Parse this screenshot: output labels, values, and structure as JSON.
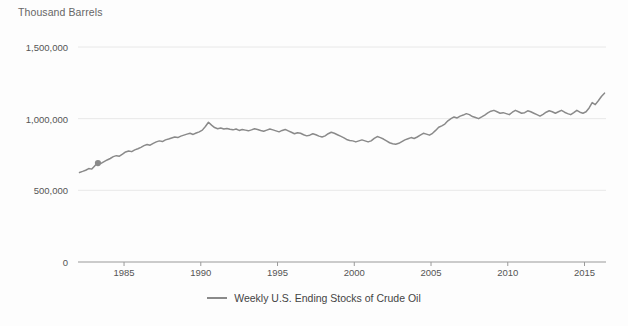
{
  "chart_data": {
    "type": "line",
    "title": "",
    "ylabel": "Thousand Barrels",
    "xlabel": "",
    "ylim": [
      0,
      1500000
    ],
    "xlim": [
      1982,
      2016.4
    ],
    "grid": true,
    "legend_position": "bottom",
    "yticks": [
      0,
      500000,
      1000000,
      1500000
    ],
    "ytick_labels": [
      "0",
      "500,000",
      "1,000,000",
      "1,500,000"
    ],
    "xticks": [
      1985,
      1990,
      1995,
      2000,
      2005,
      2010,
      2015
    ],
    "xtick_labels": [
      "1985",
      "1990",
      "1995",
      "2000",
      "2005",
      "2010",
      "2015"
    ],
    "line_color": "#8a8a8a",
    "grid_color": "#e8e8e8",
    "axis_color": "#9a9a9a",
    "background_color": "#fdfdfd",
    "series": [
      {
        "name": "Weekly U.S. Ending Stocks of Crude Oil",
        "color": "#8a8a8a",
        "marker": "dot-1983",
        "x": [
          1982.1,
          1982.3,
          1982.5,
          1982.7,
          1982.9,
          1983.1,
          1983.3,
          1983.5,
          1983.7,
          1983.9,
          1984.1,
          1984.3,
          1984.5,
          1984.7,
          1984.9,
          1985.1,
          1985.3,
          1985.5,
          1985.7,
          1985.9,
          1986.1,
          1986.3,
          1986.5,
          1986.7,
          1986.9,
          1987.1,
          1987.3,
          1987.5,
          1987.7,
          1987.9,
          1988.1,
          1988.3,
          1988.5,
          1988.7,
          1988.9,
          1989.1,
          1989.3,
          1989.5,
          1989.7,
          1989.9,
          1990.1,
          1990.3,
          1990.5,
          1990.7,
          1990.9,
          1991.1,
          1991.3,
          1991.5,
          1991.7,
          1991.9,
          1992.1,
          1992.3,
          1992.5,
          1992.7,
          1992.9,
          1993.1,
          1993.3,
          1993.5,
          1993.7,
          1993.9,
          1994.1,
          1994.3,
          1994.5,
          1994.7,
          1994.9,
          1995.1,
          1995.3,
          1995.5,
          1995.7,
          1995.9,
          1996.1,
          1996.3,
          1996.5,
          1996.7,
          1996.9,
          1997.1,
          1997.3,
          1997.5,
          1997.7,
          1997.9,
          1998.1,
          1998.3,
          1998.5,
          1998.7,
          1998.9,
          1999.1,
          1999.3,
          1999.5,
          1999.7,
          1999.9,
          2000.1,
          2000.3,
          2000.5,
          2000.7,
          2000.9,
          2001.1,
          2001.3,
          2001.5,
          2001.7,
          2001.9,
          2002.1,
          2002.3,
          2002.5,
          2002.7,
          2002.9,
          2003.1,
          2003.3,
          2003.5,
          2003.7,
          2003.9,
          2004.1,
          2004.3,
          2004.5,
          2004.7,
          2004.9,
          2005.1,
          2005.3,
          2005.5,
          2005.7,
          2005.9,
          2006.1,
          2006.3,
          2006.5,
          2006.7,
          2006.9,
          2007.1,
          2007.3,
          2007.5,
          2007.7,
          2007.9,
          2008.1,
          2008.3,
          2008.5,
          2008.7,
          2008.9,
          2009.1,
          2009.3,
          2009.5,
          2009.7,
          2009.9,
          2010.1,
          2010.3,
          2010.5,
          2010.7,
          2010.9,
          2011.1,
          2011.3,
          2011.5,
          2011.7,
          2011.9,
          2012.1,
          2012.3,
          2012.5,
          2012.7,
          2012.9,
          2013.1,
          2013.3,
          2013.5,
          2013.7,
          2013.9,
          2014.1,
          2014.3,
          2014.5,
          2014.7,
          2014.9,
          2015.1,
          2015.3,
          2015.5,
          2015.7,
          2015.9,
          2016.1,
          2016.3
        ],
        "y": [
          625000,
          632000,
          640000,
          652000,
          648000,
          672000,
          690000,
          688000,
          700000,
          712000,
          722000,
          735000,
          742000,
          738000,
          752000,
          768000,
          775000,
          770000,
          782000,
          790000,
          800000,
          812000,
          820000,
          815000,
          828000,
          838000,
          845000,
          840000,
          852000,
          858000,
          865000,
          872000,
          868000,
          878000,
          885000,
          892000,
          898000,
          890000,
          900000,
          908000,
          920000,
          945000,
          975000,
          955000,
          938000,
          930000,
          935000,
          928000,
          932000,
          926000,
          922000,
          928000,
          918000,
          925000,
          920000,
          915000,
          922000,
          930000,
          925000,
          918000,
          912000,
          920000,
          928000,
          922000,
          915000,
          908000,
          918000,
          925000,
          915000,
          905000,
          895000,
          902000,
          898000,
          888000,
          880000,
          885000,
          895000,
          888000,
          878000,
          872000,
          880000,
          895000,
          905000,
          898000,
          888000,
          878000,
          868000,
          855000,
          848000,
          845000,
          838000,
          845000,
          852000,
          845000,
          838000,
          845000,
          862000,
          875000,
          868000,
          858000,
          845000,
          832000,
          825000,
          822000,
          828000,
          840000,
          852000,
          860000,
          868000,
          862000,
          872000,
          885000,
          898000,
          892000,
          885000,
          898000,
          918000,
          940000,
          950000,
          962000,
          985000,
          1000000,
          1012000,
          1005000,
          1018000,
          1025000,
          1035000,
          1028000,
          1015000,
          1008000,
          1000000,
          1012000,
          1025000,
          1040000,
          1052000,
          1058000,
          1048000,
          1038000,
          1042000,
          1035000,
          1028000,
          1045000,
          1058000,
          1048000,
          1038000,
          1042000,
          1055000,
          1048000,
          1038000,
          1028000,
          1018000,
          1030000,
          1045000,
          1055000,
          1048000,
          1038000,
          1048000,
          1058000,
          1045000,
          1035000,
          1028000,
          1042000,
          1058000,
          1045000,
          1038000,
          1048000,
          1075000,
          1112000,
          1098000,
          1125000,
          1155000,
          1178000
        ]
      }
    ]
  },
  "legend": {
    "label": "Weekly U.S. Ending Stocks of Crude Oil"
  }
}
